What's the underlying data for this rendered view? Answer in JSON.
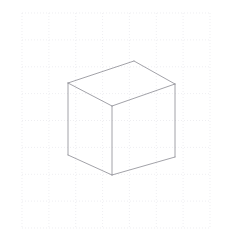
{
  "figure": {
    "title": "Isometric cube wireframe on dotted graph paper",
    "background_color": "#ffffff",
    "width": 231,
    "height": 233
  },
  "grid": {
    "name": "dotted-graph-grid",
    "line_color": "#e2e2e8",
    "line_width": 0.6,
    "dash_pattern": "1,2",
    "x_start": 22,
    "x_end": 210,
    "y_start": 13,
    "y_end": 228,
    "cell_width": 26.857,
    "cell_height": 26.875,
    "columns": 7,
    "rows": 8,
    "vertical_lines": [
      22,
      48.9,
      75.7,
      102.6,
      129.4,
      156.3,
      183.1,
      210
    ],
    "horizontal_lines": [
      13,
      39.9,
      66.8,
      93.6,
      120.5,
      147.4,
      174.3,
      201.1,
      228
    ]
  },
  "cube": {
    "name": "isometric-cube",
    "stroke_color": "#8a8a92",
    "stroke_width": 0.8,
    "fill": "none",
    "vertices": {
      "top_back": [
        134,
        61
      ],
      "top_left": [
        68,
        83
      ],
      "top_right": [
        175,
        84
      ],
      "front_top_center": [
        112,
        106
      ],
      "bottom_left": [
        68,
        155
      ],
      "bottom_center": [
        112,
        175
      ],
      "bottom_right": [
        175,
        157
      ]
    },
    "faces": [
      {
        "name": "top-face",
        "points": "134,61 68,83 112,106 175,84"
      },
      {
        "name": "left-face",
        "points": "68,83 68,155 112,175 112,106"
      },
      {
        "name": "right-face",
        "points": "112,106 112,175 175,157 175,84"
      }
    ],
    "edges": [
      {
        "name": "edge-top-back-to-top-left",
        "x1": 134,
        "y1": 61,
        "x2": 68,
        "y2": 83
      },
      {
        "name": "edge-top-back-to-top-right",
        "x1": 134,
        "y1": 61,
        "x2": 175,
        "y2": 84
      },
      {
        "name": "edge-top-left-to-front-center",
        "x1": 68,
        "y1": 83,
        "x2": 112,
        "y2": 106
      },
      {
        "name": "edge-top-right-to-front-center",
        "x1": 175,
        "y1": 84,
        "x2": 112,
        "y2": 106
      },
      {
        "name": "edge-left-vertical",
        "x1": 68,
        "y1": 83,
        "x2": 68,
        "y2": 155
      },
      {
        "name": "edge-front-vertical",
        "x1": 112,
        "y1": 106,
        "x2": 112,
        "y2": 175
      },
      {
        "name": "edge-right-vertical",
        "x1": 175,
        "y1": 84,
        "x2": 175,
        "y2": 157
      },
      {
        "name": "edge-bottom-left-to-bottom-center",
        "x1": 68,
        "y1": 155,
        "x2": 112,
        "y2": 175
      },
      {
        "name": "edge-bottom-center-to-bottom-right",
        "x1": 112,
        "y1": 175,
        "x2": 175,
        "y2": 157
      }
    ]
  }
}
